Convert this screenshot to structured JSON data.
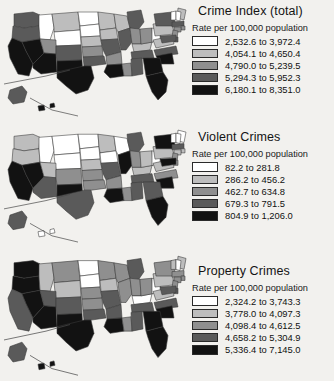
{
  "document": {
    "kind": "scanned-figure-page",
    "background_color": "#f2f1ee",
    "panel_count": 3
  },
  "shared": {
    "subtitle": "Rate per 100,000 population",
    "class_colors": [
      "#ffffff",
      "#bdbdbd",
      "#8f8f8f",
      "#5a5a5a",
      "#121212"
    ]
  },
  "chart_data": {
    "type": "choropleth-map-series",
    "map_region": "United States (50 states, Alaska and Hawaii as insets)",
    "class_count": 5,
    "color_scale": [
      "#ffffff",
      "#bdbdbd",
      "#8f8f8f",
      "#5a5a5a",
      "#121212"
    ],
    "panels": [
      {
        "title": "Crime Index (total)",
        "subtitle": "Rate per 100,000 population",
        "unit": "rate per 100,000 population",
        "legend": [
          {
            "class": 1,
            "label": "2,532.6 to 3,972.4",
            "min": 2532.6,
            "max": 3972.4,
            "color": "#ffffff"
          },
          {
            "class": 2,
            "label": "4,054.1 to 4,650.4",
            "min": 4054.1,
            "max": 4650.4,
            "color": "#bdbdbd"
          },
          {
            "class": 3,
            "label": "4,790.0 to 5,239.5",
            "min": 4790.0,
            "max": 5239.5,
            "color": "#8f8f8f"
          },
          {
            "class": 4,
            "label": "5,294.3 to 5,952.3",
            "min": 5294.3,
            "max": 5952.3,
            "color": "#5a5a5a"
          },
          {
            "class": 5,
            "label": "6,180.1 to 8,351.0",
            "min": 6180.1,
            "max": 8351.0,
            "color": "#121212"
          }
        ],
        "state_classes": {
          "WA": 4,
          "OR": 4,
          "CA": 5,
          "NV": 5,
          "ID": 1,
          "MT": 2,
          "WY": 1,
          "UT": 3,
          "AZ": 5,
          "CO": 4,
          "NM": 5,
          "ND": 1,
          "SD": 1,
          "NE": 2,
          "KS": 3,
          "OK": 4,
          "TX": 5,
          "MN": 2,
          "IA": 2,
          "MO": 4,
          "AR": 3,
          "LA": 5,
          "WI": 2,
          "IL": 4,
          "MS": 3,
          "MI": 4,
          "IN": 3,
          "KY": 2,
          "TN": 4,
          "AL": 4,
          "OH": 3,
          "WV": 1,
          "VA": 2,
          "NC": 4,
          "SC": 5,
          "GA": 5,
          "FL": 5,
          "PA": 2,
          "NY": 4,
          "ME": 2,
          "VT": 1,
          "NH": 1,
          "MA": 4,
          "RI": 3,
          "CT": 3,
          "NJ": 3,
          "DE": 4,
          "MD": 4,
          "AK": 4,
          "HI": 5
        }
      },
      {
        "title": "Violent Crimes",
        "subtitle": "Rate per 100,000 population",
        "unit": "rate per 100,000 population",
        "legend": [
          {
            "class": 1,
            "label": "82.2 to 281.8",
            "min": 82.2,
            "max": 281.8,
            "color": "#ffffff"
          },
          {
            "class": 2,
            "label": "286.2 to 456.2",
            "min": 286.2,
            "max": 456.2,
            "color": "#bdbdbd"
          },
          {
            "class": 3,
            "label": "462.7 to 634.8",
            "min": 462.7,
            "max": 634.8,
            "color": "#8f8f8f"
          },
          {
            "class": 4,
            "label": "679.3 to 791.5",
            "min": 679.3,
            "max": 791.5,
            "color": "#5a5a5a"
          },
          {
            "class": 5,
            "label": "804.9 to 1,206.0",
            "min": 804.9,
            "max": 1206.0,
            "color": "#121212"
          }
        ],
        "state_classes": {
          "WA": 2,
          "OR": 2,
          "CA": 5,
          "NV": 5,
          "ID": 1,
          "MT": 1,
          "WY": 1,
          "UT": 2,
          "AZ": 4,
          "CO": 3,
          "NM": 5,
          "ND": 1,
          "SD": 1,
          "NE": 2,
          "KS": 3,
          "OK": 3,
          "TX": 4,
          "MN": 2,
          "IA": 1,
          "MO": 4,
          "AR": 3,
          "LA": 5,
          "WI": 1,
          "IL": 5,
          "MS": 3,
          "MI": 4,
          "IN": 3,
          "KY": 2,
          "TN": 4,
          "AL": 4,
          "OH": 2,
          "WV": 1,
          "VA": 2,
          "NC": 3,
          "SC": 5,
          "GA": 4,
          "FL": 5,
          "PA": 2,
          "NY": 5,
          "ME": 1,
          "VT": 1,
          "NH": 1,
          "MA": 4,
          "RI": 2,
          "CT": 2,
          "NJ": 3,
          "DE": 3,
          "MD": 5,
          "AK": 4,
          "HI": 1
        }
      },
      {
        "title": "Property Crimes",
        "subtitle": "Rate per 100,000 population",
        "unit": "rate per 100,000 population",
        "legend": [
          {
            "class": 1,
            "label": "2,324.2 to 3,743.3",
            "min": 2324.2,
            "max": 3743.3,
            "color": "#ffffff"
          },
          {
            "class": 2,
            "label": "3,778.0 to 4,097.3",
            "min": 3778.0,
            "max": 4097.3,
            "color": "#bdbdbd"
          },
          {
            "class": 3,
            "label": "4,098.4 to 4,612.5",
            "min": 4098.4,
            "max": 4612.5,
            "color": "#8f8f8f"
          },
          {
            "class": 4,
            "label": "4,658.2 to 5,304.9",
            "min": 4658.2,
            "max": 5304.9,
            "color": "#5a5a5a"
          },
          {
            "class": 5,
            "label": "5,336.4 to 7,145.0",
            "min": 5336.4,
            "max": 7145.0,
            "color": "#121212"
          }
        ],
        "state_classes": {
          "WA": 5,
          "OR": 5,
          "CA": 4,
          "NV": 5,
          "ID": 2,
          "MT": 3,
          "WY": 2,
          "UT": 4,
          "AZ": 5,
          "CO": 4,
          "NM": 5,
          "ND": 1,
          "SD": 1,
          "NE": 3,
          "KS": 3,
          "OK": 4,
          "TX": 5,
          "MN": 3,
          "IA": 2,
          "MO": 4,
          "AR": 4,
          "LA": 5,
          "WI": 3,
          "IL": 3,
          "MS": 3,
          "MI": 4,
          "IN": 3,
          "KY": 1,
          "TN": 4,
          "AL": 4,
          "OH": 3,
          "WV": 1,
          "VA": 2,
          "NC": 4,
          "SC": 5,
          "GA": 5,
          "FL": 5,
          "PA": 2,
          "NY": 3,
          "ME": 2,
          "VT": 2,
          "NH": 1,
          "MA": 3,
          "RI": 3,
          "CT": 3,
          "NJ": 3,
          "DE": 4,
          "MD": 4,
          "AK": 4,
          "HI": 5
        }
      }
    ]
  }
}
